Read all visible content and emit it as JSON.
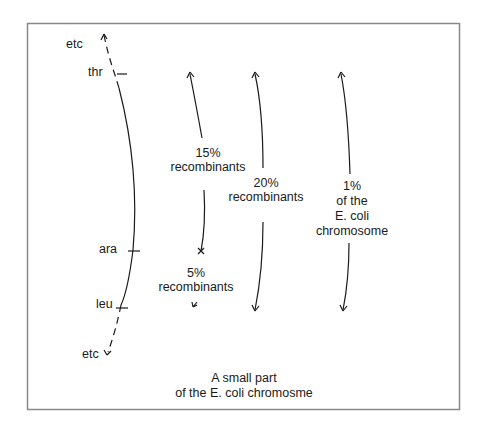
{
  "diagram": {
    "chromosome_labels": {
      "top_etc": "etc",
      "thr": "thr",
      "ara": "ara",
      "leu": "leu",
      "bottom_etc": "etc"
    },
    "distances": [
      {
        "id": "thr_ara",
        "percent": "15%",
        "label": "recombinants"
      },
      {
        "id": "ara_leu",
        "percent": "5%",
        "label": "recombinants"
      },
      {
        "id": "thr_leu",
        "percent": "20%",
        "label": "recombinants"
      },
      {
        "id": "chromosome_fraction",
        "percent": "1%",
        "line2": "of the",
        "line3": "E. coli",
        "line4": "chromosome"
      }
    ],
    "caption": {
      "line1": "A small part",
      "line2": "of the E. coli chromosme"
    },
    "colors": {
      "ink": "#1a1a1a",
      "frame": "#888888",
      "background": "#ffffff"
    }
  }
}
